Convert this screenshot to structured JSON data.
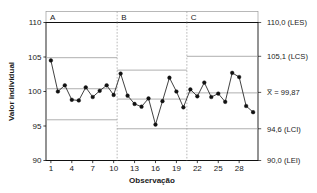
{
  "chart_data": {
    "type": "line",
    "title": "",
    "subtitle": "",
    "xlabel": "Observação",
    "ylabel": "Valor individual",
    "xlim": [
      0.3,
      30.7
    ],
    "ylim": [
      90,
      110
    ],
    "yticks": [
      90,
      95,
      100,
      105,
      110
    ],
    "ytick_labels": [
      "90",
      "95",
      "100",
      "105",
      "110"
    ],
    "xticks": [
      1,
      4,
      7,
      10,
      13,
      16,
      19,
      22,
      25,
      28
    ],
    "xtick_labels": [
      "1",
      "4",
      "7",
      "10",
      "13",
      "16",
      "19",
      "22",
      "25",
      "28"
    ],
    "grid": false,
    "legend": "none",
    "x": [
      1,
      2,
      3,
      4,
      5,
      6,
      7,
      8,
      9,
      10,
      11,
      12,
      13,
      14,
      15,
      16,
      17,
      18,
      19,
      20,
      21,
      22,
      23,
      24,
      25,
      26,
      27,
      28,
      29,
      30
    ],
    "series": [
      {
        "name": "Valor individual",
        "marker": "filled-circle",
        "color": "#111111",
        "values": [
          104.5,
          100.0,
          100.9,
          98.8,
          98.7,
          100.6,
          99.2,
          100.1,
          100.9,
          99.5,
          102.6,
          99.4,
          98.2,
          97.8,
          99.0,
          95.2,
          98.6,
          102.0,
          100.0,
          97.7,
          100.3,
          99.3,
          101.3,
          99.2,
          99.7,
          98.5,
          102.7,
          102.1,
          97.9,
          97.0
        ]
      }
    ],
    "stages": [
      {
        "label": "A",
        "x_start": 0.3,
        "x_end": 10.5,
        "center": 100.4,
        "ucl": 104.9,
        "lcl": 95.9
      },
      {
        "label": "B",
        "x_start": 10.5,
        "x_end": 20.5,
        "center": 98.9,
        "ucl": 103.1,
        "lcl": 94.6
      },
      {
        "label": "C",
        "x_start": 20.5,
        "x_end": 30.7,
        "center": 99.8,
        "ucl": 105.1,
        "lcl": 94.6
      }
    ],
    "reference_lines": [
      {
        "name": "LES",
        "value": 110.0,
        "label": "110,0 (LES)",
        "style": "solid-heavy",
        "color": "#111111"
      },
      {
        "name": "LCS",
        "value": 105.1,
        "label": "105,1 (LCS)",
        "style": "solid-light",
        "color": "#9a9a9a"
      },
      {
        "name": "Xbar",
        "value": 99.87,
        "label": "X̅ = 99,87",
        "style": "solid-light",
        "color": "#9a9a9a"
      },
      {
        "name": "LCI",
        "value": 94.6,
        "label": "94,6 (LCI)",
        "style": "solid-light",
        "color": "#9a9a9a"
      },
      {
        "name": "LEI",
        "value": 90.0,
        "label": "90,0 (LEI)",
        "style": "solid-heavy",
        "color": "#111111"
      }
    ],
    "stage_dividers": [
      10.5,
      20.5
    ],
    "colors": {
      "line": "#111111",
      "marker": "#111111",
      "spec_limit": "#111111",
      "control_limit": "#9a9a9a",
      "divider": "#9a9a9a",
      "axis": "#111111",
      "background": "#ffffff"
    }
  },
  "axes": {
    "y_title": "Valor individual",
    "x_title": "Observação"
  },
  "right_labels": [
    "110,0 (LES)",
    "105,1 (LCS)",
    "X̅ = 99,87",
    "94,6 (LCI)",
    "90,0 (LEI)"
  ],
  "stage_labels": [
    "A",
    "B",
    "C"
  ],
  "ytick_labels": [
    "110",
    "105",
    "100",
    "95",
    "90"
  ],
  "xtick_labels": [
    "1",
    "4",
    "7",
    "10",
    "13",
    "16",
    "19",
    "22",
    "25",
    "28"
  ]
}
